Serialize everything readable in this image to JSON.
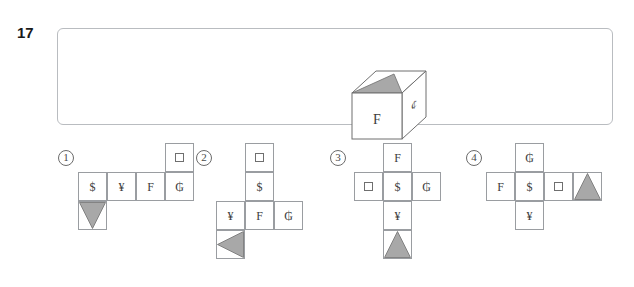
{
  "question": {
    "number": "17",
    "prompt_cube": {
      "front_face": "F",
      "right_face": "¢",
      "top_face": "gray-triangle",
      "top_face_shape": "triangle"
    }
  },
  "colors": {
    "panel_border": "#b9bcc0",
    "cell_border": "#9a9da1",
    "triangle_fill": "#a8a8a8",
    "triangle_stroke": "#6f6f6f",
    "text": "#3c3c3c",
    "number": "#1a1a1a"
  },
  "options": [
    {
      "label": "1",
      "layout": "row-of-four-with-top-and-bottom-tabs",
      "cells": [
        {
          "id": "o1c1",
          "content": "$",
          "type": "text",
          "col": 0,
          "row": 1
        },
        {
          "id": "o1c2",
          "content": "¥",
          "type": "text",
          "col": 1,
          "row": 1
        },
        {
          "id": "o1c3",
          "content": "F",
          "type": "text",
          "col": 2,
          "row": 1
        },
        {
          "id": "o1c4",
          "content": "₲",
          "type": "text",
          "col": 3,
          "row": 1
        },
        {
          "id": "o1c5",
          "content": "square",
          "type": "square",
          "col": 3,
          "row": 0
        },
        {
          "id": "o1c6",
          "content": "triangle-down",
          "type": "triangle",
          "col": 0,
          "row": 2
        }
      ]
    },
    {
      "label": "2",
      "layout": "column-two-with-row-of-three",
      "cells": [
        {
          "id": "o2c1",
          "content": "square",
          "type": "square",
          "col": 1,
          "row": 0
        },
        {
          "id": "o2c2",
          "content": "$",
          "type": "text",
          "col": 1,
          "row": 1
        },
        {
          "id": "o2c3",
          "content": "¥",
          "type": "text",
          "col": 0,
          "row": 2
        },
        {
          "id": "o2c4",
          "content": "F",
          "type": "text",
          "col": 1,
          "row": 2
        },
        {
          "id": "o2c5",
          "content": "₲",
          "type": "text",
          "col": 2,
          "row": 2
        },
        {
          "id": "o2c6",
          "content": "triangle-left",
          "type": "triangle",
          "col": 0,
          "row": 3
        }
      ]
    },
    {
      "label": "3",
      "layout": "cross",
      "cells": [
        {
          "id": "o3c1",
          "content": "F",
          "type": "text",
          "col": 1,
          "row": 0
        },
        {
          "id": "o3c2",
          "content": "square",
          "type": "square",
          "col": 0,
          "row": 1
        },
        {
          "id": "o3c3",
          "content": "$",
          "type": "text",
          "col": 1,
          "row": 1
        },
        {
          "id": "o3c4",
          "content": "₲",
          "type": "text",
          "col": 2,
          "row": 1
        },
        {
          "id": "o3c5",
          "content": "¥",
          "type": "text",
          "col": 1,
          "row": 2
        },
        {
          "id": "o3c6",
          "content": "triangle-up",
          "type": "triangle",
          "col": 1,
          "row": 3
        }
      ]
    },
    {
      "label": "4",
      "layout": "cross-with-right-tab",
      "cells": [
        {
          "id": "o4c1",
          "content": "₲",
          "type": "text",
          "col": 1,
          "row": 0
        },
        {
          "id": "o4c2",
          "content": "F",
          "type": "text",
          "col": 0,
          "row": 1
        },
        {
          "id": "o4c3",
          "content": "$",
          "type": "text",
          "col": 1,
          "row": 1
        },
        {
          "id": "o4c4",
          "content": "square",
          "type": "square",
          "col": 2,
          "row": 1
        },
        {
          "id": "o4c5",
          "content": "triangle-up",
          "type": "triangle",
          "col": 3,
          "row": 1
        },
        {
          "id": "o4c6",
          "content": "¥",
          "type": "text",
          "col": 1,
          "row": 2
        }
      ]
    }
  ]
}
